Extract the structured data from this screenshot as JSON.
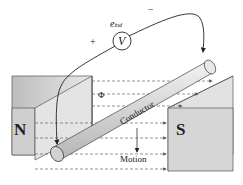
{
  "diagram": {
    "title": "",
    "labels": {
      "north_pole": "N",
      "south_pole": "S",
      "conductor": "Conductor",
      "motion": "Motion",
      "flux": "Φ",
      "voltmeter": "V",
      "emf": "e",
      "emf_subscript": "ind",
      "plus": "+",
      "minus": "−"
    },
    "colors": {
      "magnet_face": "#c8c8c8",
      "magnet_top": "#e6e6e6",
      "conductor": "#dcdcdc",
      "lines": "#333333"
    }
  }
}
